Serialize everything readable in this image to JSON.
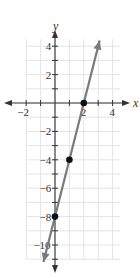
{
  "chart_data": {
    "type": "line",
    "title": "",
    "xlabel": "x",
    "ylabel": "y",
    "xlim": [
      -2.5,
      4.8
    ],
    "ylim": [
      -11.5,
      4.8
    ],
    "grid": true,
    "x_ticks": [
      -2,
      2,
      4
    ],
    "y_ticks": [
      4,
      2,
      -2,
      -4,
      -6,
      -8,
      -10
    ],
    "x_tick_labels": [
      "−2",
      "2",
      "4"
    ],
    "y_tick_labels": [
      "4",
      "2",
      "−2",
      "−4",
      "−6",
      "−8",
      "−10"
    ],
    "series": [
      {
        "name": "y = 4x - 8",
        "equation": "y = 4x − 8",
        "slope": 4,
        "intercept": -8,
        "x": [
          -0.8,
          3.1
        ],
        "y": [
          -11.2,
          4.4
        ],
        "color": "#7a7a7a"
      }
    ],
    "points": [
      {
        "x": 2,
        "y": 0
      },
      {
        "x": 1,
        "y": -4
      },
      {
        "x": 0,
        "y": -8
      }
    ],
    "colors": {
      "grid": "#e4e4e4",
      "axis": "#333333",
      "line": "#7a7a7a",
      "point": "#111111"
    }
  }
}
